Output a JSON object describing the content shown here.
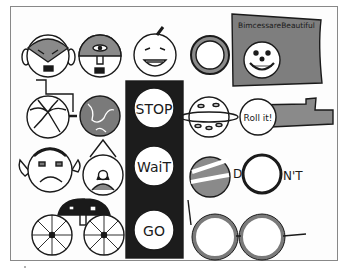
{
  "illustration": {
    "title": "Circle drawings collage",
    "colors": {
      "ink": "#1a1a1a",
      "gray_fill": "#8a8a8a",
      "dark_fill": "#1c1c1c",
      "paper": "#fdfdfd",
      "frame": "#888888"
    },
    "flag": {
      "text": "BimcessareBeautiful"
    },
    "traffic_light": {
      "stop": "STOP",
      "wait": "WaiT",
      "go": "GO"
    },
    "ship": {
      "text": "Roll it!"
    },
    "dont": {
      "d": "D",
      "nt": "N'T"
    },
    "items": [
      {
        "name": "vampire-face"
      },
      {
        "name": "cyclops-face"
      },
      {
        "name": "pumpkin-face"
      },
      {
        "name": "ring"
      },
      {
        "name": "smiley-flag"
      },
      {
        "name": "wheelchair"
      },
      {
        "name": "globe"
      },
      {
        "name": "traffic-light"
      },
      {
        "name": "saturn-planet"
      },
      {
        "name": "ship-porthole"
      },
      {
        "name": "sad-face"
      },
      {
        "name": "framed-portrait"
      },
      {
        "name": "striped-ball"
      },
      {
        "name": "dont-sign"
      },
      {
        "name": "car"
      },
      {
        "name": "glasses"
      }
    ]
  }
}
